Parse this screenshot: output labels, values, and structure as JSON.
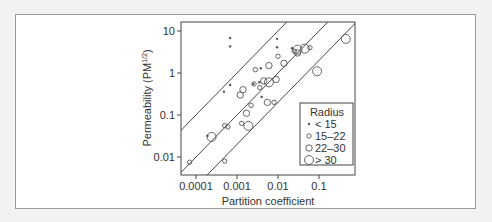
{
  "chart_data": {
    "type": "scatter",
    "title": "",
    "xlabel": "Partition coefficient",
    "ylabel": "Permeability (PM^1/2)",
    "xscale": "log",
    "yscale": "log",
    "xlim": [
      6e-05,
      0.6
    ],
    "ylim": [
      0.005,
      16
    ],
    "xticks": [
      0.0001,
      0.001,
      0.01,
      0.1
    ],
    "xtick_labels": [
      "0.0001",
      "0.001",
      "0.01",
      "0.1"
    ],
    "yticks": [
      0.01,
      0.1,
      1,
      10
    ],
    "ytick_labels": [
      "0.01",
      "0.1",
      "1",
      "10"
    ],
    "grid": false,
    "legend": {
      "title": "Radius",
      "position": "lower right",
      "entries": [
        "< 15",
        "15–22",
        "22–30",
        "> 30"
      ]
    },
    "series": [
      {
        "name": "< 15",
        "marker_size": 1.2,
        "points": [
          [
            0.00068,
            6.8
          ],
          [
            0.00068,
            4.3
          ],
          [
            0.0095,
            6.5
          ],
          [
            0.0095,
            4.1
          ],
          [
            0.00068,
            0.52
          ],
          [
            0.00048,
            0.36
          ],
          [
            0.022,
            3.9
          ],
          [
            0.0038,
            1.3
          ],
          [
            0.00019,
            0.032
          ],
          [
            0.0035,
            0.6
          ],
          [
            0.0025,
            0.55
          ],
          [
            0.004,
            0.27
          ]
        ]
      },
      {
        "name": "15–22",
        "marker_size": 2.2,
        "points": [
          [
            7e-05,
            0.0075
          ],
          [
            0.0005,
            0.056
          ],
          [
            0.0006,
            0.052
          ],
          [
            0.0013,
            0.063
          ],
          [
            0.0005,
            0.008
          ],
          [
            0.0028,
            1.2
          ],
          [
            0.0026,
            0.55
          ],
          [
            0.025,
            3.3
          ],
          [
            0.06,
            4.0
          ],
          [
            0.008,
            0.2
          ],
          [
            0.0022,
            0.17
          ],
          [
            0.0036,
            0.45
          ],
          [
            0.01,
            2.5
          ]
        ]
      },
      {
        "name": "22–30",
        "marker_size": 3.2,
        "points": [
          [
            0.0017,
            0.11
          ],
          [
            0.0012,
            0.3
          ],
          [
            0.0014,
            0.4
          ],
          [
            0.006,
            1.5
          ],
          [
            0.014,
            1.7
          ],
          [
            0.0045,
            0.65
          ],
          [
            0.009,
            0.7
          ],
          [
            0.03,
            3.0
          ],
          [
            0.0055,
            0.2
          ]
        ]
      },
      {
        "name": "> 30",
        "marker_size": 4.5,
        "points": [
          [
            0.00024,
            0.03
          ],
          [
            0.0019,
            0.055
          ],
          [
            0.006,
            0.6
          ],
          [
            0.03,
            3.6
          ],
          [
            0.045,
            3.8
          ],
          [
            0.09,
            1.1
          ],
          [
            0.45,
            6.5
          ]
        ]
      }
    ],
    "reference_lines": [
      {
        "name": "upper",
        "slope": 1,
        "intercept_log": 3.0
      },
      {
        "name": "middle",
        "slope": 1,
        "intercept_log": 2.0
      },
      {
        "name": "lower",
        "slope": 1,
        "intercept_log": 1.3
      }
    ]
  }
}
